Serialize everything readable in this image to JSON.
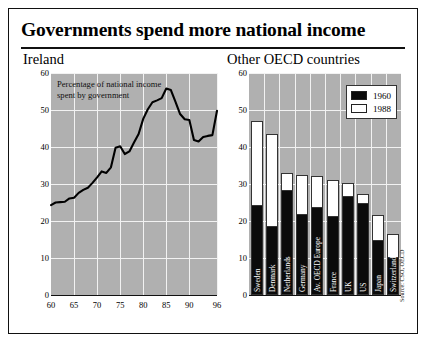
{
  "header": {
    "title": "Governments spend more national income"
  },
  "source_note": "Source: CSO, OECD",
  "chart_data": [
    {
      "type": "line",
      "title": "Ireland",
      "annotation": "Percentage of national income spent by government",
      "annotation_line1": "Percentage of national income",
      "annotation_line2": "spent by government",
      "xlabel": "",
      "ylabel": "",
      "xlim": [
        60,
        96
      ],
      "ylim": [
        0,
        60
      ],
      "grid": true,
      "xticks": [
        "60",
        "65",
        "70",
        "75",
        "80",
        "85",
        "90",
        "96"
      ],
      "xtick_values": [
        60,
        65,
        70,
        75,
        80,
        85,
        90,
        96
      ],
      "yticks": [
        "0",
        "10",
        "20",
        "30",
        "40",
        "50",
        "60"
      ],
      "ytick_values": [
        0,
        10,
        20,
        30,
        40,
        50,
        60
      ],
      "x": [
        60,
        61,
        62,
        63,
        64,
        65,
        66,
        67,
        68,
        69,
        70,
        71,
        72,
        73,
        74,
        75,
        76,
        77,
        78,
        79,
        80,
        81,
        82,
        83,
        84,
        85,
        86,
        87,
        88,
        89,
        90,
        91,
        92,
        93,
        94,
        95,
        96
      ],
      "values": [
        24.3,
        25.0,
        25.1,
        25.2,
        26.1,
        26.3,
        27.6,
        28.4,
        29.0,
        30.3,
        31.8,
        33.4,
        33.0,
        34.5,
        39.8,
        40.2,
        38.1,
        38.8,
        41.2,
        43.5,
        47.6,
        50.2,
        52.1,
        52.6,
        53.2,
        55.8,
        55.4,
        52.2,
        48.9,
        47.5,
        47.3,
        41.9,
        41.5,
        42.7,
        43.0,
        43.2,
        49.8
      ]
    },
    {
      "type": "bar",
      "title": "Other OECD countries",
      "xlabel": "",
      "ylabel": "",
      "ylim": [
        0,
        60
      ],
      "grid": true,
      "yticks": [
        "0",
        "10",
        "20",
        "30",
        "40",
        "50",
        "60"
      ],
      "ytick_values": [
        0,
        10,
        20,
        30,
        40,
        50,
        60
      ],
      "legend_position": "top-right",
      "categories": [
        "Sweden",
        "Denmark",
        "Netherlands",
        "Germany",
        "Av. OECD Europe",
        "France",
        "UK",
        "US",
        "Japan",
        "Switzerland"
      ],
      "series": [
        {
          "name": "1960",
          "color": "#0b0b0b",
          "values": [
            24.0,
            18.5,
            28.0,
            21.6,
            23.5,
            21.0,
            26.5,
            24.5,
            14.5,
            10.0
          ]
        },
        {
          "name": "1988",
          "color": "#ffffff",
          "values": [
            47.0,
            43.5,
            33.0,
            32.4,
            32.2,
            31.2,
            30.2,
            27.3,
            21.5,
            16.5
          ]
        }
      ]
    }
  ]
}
